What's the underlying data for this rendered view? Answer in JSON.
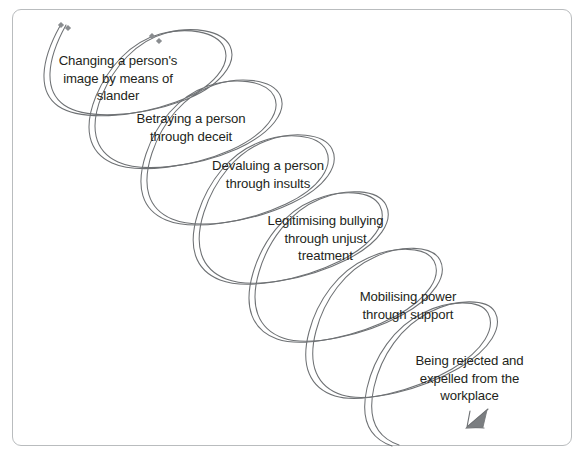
{
  "figure": {
    "type": "downward-spiral-diagram",
    "border_color": "#b9bcbe",
    "background_color": "#ffffff",
    "stroke_color": "#6e7174",
    "text_color": "#231f20",
    "caption_fragment": "",
    "start_marker": "diamond",
    "end_marker": "arrowhead",
    "direction": "descending left-to-right",
    "stages": [
      {
        "index": 1,
        "text": "Changing a person's\nimage by means of\nslander",
        "name": "stage-changing-image"
      },
      {
        "index": 2,
        "text": "Betraying a person\nthrough deceit",
        "name": "stage-betraying-person"
      },
      {
        "index": 3,
        "text": "Devaluing a person\nthrough insults",
        "name": "stage-devaluing-person"
      },
      {
        "index": 4,
        "text": "Legitimising bullying\nthrough unjust\ntreatment",
        "name": "stage-legitimising-bullying"
      },
      {
        "index": 5,
        "text": "Mobilising power\nthrough support",
        "name": "stage-mobilising-power"
      },
      {
        "index": 6,
        "text": "Being rejected and\nexpelled from the\nworkplace",
        "name": "stage-being-rejected"
      }
    ]
  }
}
